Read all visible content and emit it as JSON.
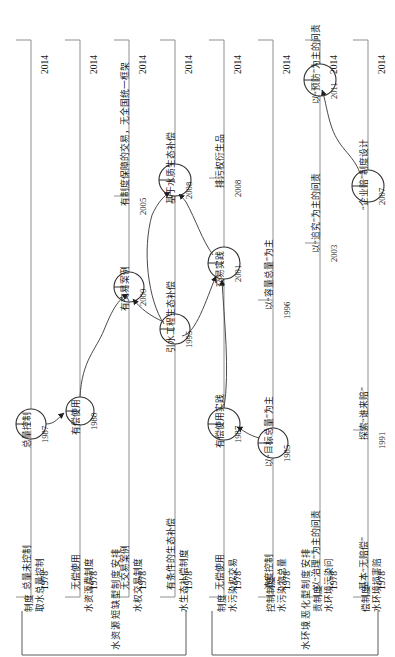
{
  "figure": {
    "axis_end_year": "2014",
    "lane_count": 8
  },
  "groups": [
    {
      "label": "水资源短缺型制度安排",
      "rows": [
        0,
        1,
        2,
        3
      ]
    },
    {
      "label": "水环境恶化型制度安排",
      "rows": [
        4,
        5,
        6,
        7
      ]
    }
  ],
  "rows": [
    {
      "name_line1": "取水总量控制",
      "name_line2": "制度",
      "start_year": "1978",
      "start_label": "总量未控制",
      "end_year": "2014",
      "events": [
        {
          "year": "1987",
          "label": "总量控制",
          "type": "circle"
        }
      ]
    },
    {
      "name_line1": "水资源费制度",
      "name_line2": "",
      "start_year": "1978",
      "start_label": "无偿使用",
      "end_year": "2014",
      "events": [
        {
          "year": "1988",
          "label": "有偿使用",
          "type": "circle"
        }
      ]
    },
    {
      "name_line1": "水权交易制度",
      "name_line2": "",
      "start_year": "1978",
      "start_label": "无交易案例",
      "end_year": "2014",
      "events": [
        {
          "year": "2000",
          "label": "有交易案例",
          "type": "circle"
        },
        {
          "year": "2005",
          "label": "有制度保障的交易，无全国统一框架",
          "type": "tick"
        }
      ]
    },
    {
      "name_line1": "水生态补偿制度",
      "name_line2": "",
      "start_year": "1978",
      "start_label": "有条件的生态补偿",
      "end_year": "2014",
      "events": [
        {
          "year": "1995",
          "label": "引水工程生态补偿",
          "type": "circle"
        },
        {
          "year": "2008",
          "label": "基于水质生态补偿",
          "type": "circle"
        }
      ]
    },
    {
      "name_line1": "水污染权交易",
      "name_line2": "制度",
      "start_year": "1978",
      "start_label": "无偿使用",
      "end_year": "2014",
      "events": [
        {
          "year": "1987",
          "label": "有偿使用实践",
          "type": "circle"
        },
        {
          "year": "2001",
          "label": "交易实践",
          "type": "circle"
        },
        {
          "year": "2008",
          "label": "排污权衍生品",
          "type": "tick"
        }
      ]
    },
    {
      "name_line1": "水污染物总量",
      "name_line2": "控制制度",
      "start_year": "1978",
      "start_label": "浓度控制",
      "end_year": "2014",
      "events": [
        {
          "year": "1985",
          "label": "以“目标总量”为主",
          "type": "circle"
        },
        {
          "year": "1996",
          "label": "以“容量总量”为主",
          "type": "tick"
        }
      ]
    },
    {
      "name_line1": "水环境污染问",
      "name_line2": "责制度",
      "start_year": "1978",
      "start_label": "以“治理”为主的问责",
      "end_year": "2014",
      "events": [
        {
          "year": "2003",
          "label": "以“追究”为主的问责",
          "type": "tick"
        },
        {
          "year": "2011",
          "label": "以“预防”为主的问责",
          "type": "circle"
        }
      ]
    },
    {
      "name_line1": "水环境损害赔",
      "name_line2": "偿制度",
      "start_year": "1978",
      "start_label": "基本“无赔偿”",
      "end_year": "2014",
      "events": [
        {
          "year": "1991",
          "label": "探索“谁来赔”",
          "type": "tick"
        },
        {
          "year": "2007",
          "label": "“企业赔”制度设计",
          "type": "circle"
        }
      ]
    }
  ],
  "colors": {
    "line": "#8a8a8a",
    "stroke": "#2a2a2a",
    "text": "#1a1a1a"
  }
}
